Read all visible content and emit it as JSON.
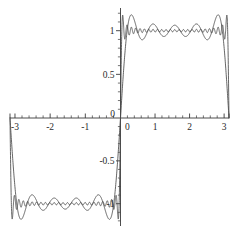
{
  "chart_data": {
    "type": "line",
    "title": "",
    "subtitle": "",
    "xlabel": "",
    "ylabel": "",
    "xlim": [
      -3.14159,
      3.14159
    ],
    "ylim": [
      -1.26,
      1.26
    ],
    "grid": false,
    "legend_position": "none",
    "annotations": [],
    "x_ticks_major": [
      -3,
      -2,
      -1,
      0,
      1,
      2,
      3
    ],
    "x_tick_labels": [
      "-3",
      "-2",
      "-1",
      "0",
      "1",
      "2",
      "3"
    ],
    "x_tick_minor_step": 0.2,
    "y_ticks_major": [
      -1,
      -0.5,
      0,
      0.5,
      1
    ],
    "y_tick_labels": [
      "-1",
      "-0.5",
      "0",
      "0.5",
      "1"
    ],
    "y_tick_minor_step": 0.1,
    "axis_origin": [
      0,
      0
    ],
    "series": [
      {
        "name": "partial sum N=5",
        "style": "solid",
        "color": "#4a4a4a",
        "fourier_odd_harmonics": [
          1,
          3,
          5,
          7,
          9
        ],
        "amplitude_scale": 1.2732395447,
        "peak_overshoot": 1.18,
        "num_ripples_per_half": 5
      },
      {
        "name": "partial sum N=25",
        "style": "solid",
        "color": "#4a4a4a",
        "fourier_odd_harmonics": [
          1,
          3,
          5,
          7,
          9,
          11,
          13,
          15,
          17,
          19,
          21,
          23,
          25,
          27,
          29,
          31,
          33,
          35,
          37,
          39,
          41,
          43,
          45,
          47,
          49
        ],
        "amplitude_scale": 1.2732395447,
        "plateau_value": 0.95,
        "num_ripples_per_half": 25
      }
    ]
  },
  "figure": {
    "background_color": "#ffffff",
    "axis_color": "#3a3a3a",
    "curve_color": "#4a4a4a"
  }
}
